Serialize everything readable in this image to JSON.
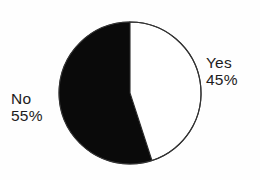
{
  "chart_data": {
    "type": "pie",
    "title": "",
    "categories": [
      "Yes",
      "No"
    ],
    "values": [
      45,
      55
    ],
    "value_unit": "%",
    "slices": [
      {
        "label": "Yes",
        "value": 45,
        "value_text": "45%",
        "color": "#ffffff",
        "outline_color": "#2a2a2a",
        "start_angle_deg": 0,
        "sweep_deg": 162
      },
      {
        "label": "No",
        "value": 55,
        "value_text": "55%",
        "color": "#0a0a0a",
        "outline_color": "#0a0a0a",
        "start_angle_deg": 162,
        "sweep_deg": 198
      }
    ],
    "legend": "none",
    "labels_position": "outside",
    "start_angle_note": "12 o'clock, clockwise",
    "grid": false,
    "xlabel": "",
    "ylabel": ""
  },
  "labels": {
    "yes": {
      "name": "Yes",
      "value": "45%"
    },
    "no": {
      "name": "No",
      "value": "55%"
    }
  },
  "colors": {
    "background": "#fefefe",
    "slice_no_fill": "#0a0a0a",
    "slice_yes_fill": "#ffffff",
    "outline": "#333333",
    "text": "#1c1c1c"
  }
}
